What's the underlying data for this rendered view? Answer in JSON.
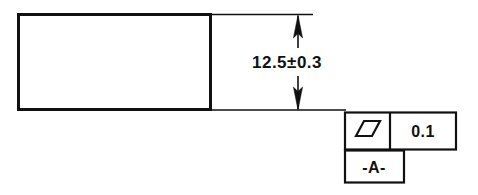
{
  "drawing": {
    "type": "gdt-engineering-drawing",
    "background_color": "#ffffff",
    "line_color": "#111111",
    "part": {
      "name": "rectangular-part-outline",
      "shape": "rectangle",
      "outline_weight": "thick"
    },
    "dimension": {
      "name": "vertical-linear-dimension",
      "text": "12.5±0.3",
      "nominal": "12.5",
      "tolerance": "±0.3",
      "plus_minus_symbol": "±",
      "orientation": "vertical",
      "arrow_style": "double-ended-closed-filled"
    },
    "feature_control_frame": {
      "name": "parallelism-feature-control-frame",
      "symbol_name": "parallelism-symbol",
      "symbol_glyph": "parallelogram",
      "tolerance_value": "0.1",
      "datum_reference": "-A-"
    },
    "datum_feature_symbol": {
      "name": "datum-feature-symbol",
      "label": "-A-",
      "letter": "A"
    }
  }
}
